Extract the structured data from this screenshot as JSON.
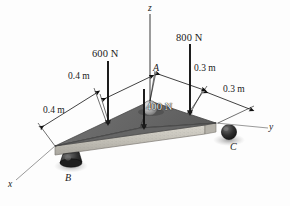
{
  "figure": {
    "type": "free-body-diagram",
    "background_color": "#fdfdfd"
  },
  "axes": [
    {
      "id": "z",
      "label": "z",
      "direction": "up"
    },
    {
      "id": "y",
      "label": "y",
      "direction": "right"
    },
    {
      "id": "x",
      "label": "x",
      "direction": "lower-left"
    }
  ],
  "points": [
    {
      "id": "A",
      "label": "A",
      "description": "apex-support-ball"
    },
    {
      "id": "B",
      "label": "B",
      "description": "left-corner-support"
    },
    {
      "id": "C",
      "label": "C",
      "description": "right-corner-support"
    }
  ],
  "forces": [
    {
      "id": "f600",
      "label": "600 N",
      "magnitude": 600,
      "unit": "N",
      "direction": "down"
    },
    {
      "id": "f800",
      "label": "800 N",
      "magnitude": 800,
      "unit": "N",
      "direction": "down"
    },
    {
      "id": "f400",
      "label": "400 N",
      "magnitude": 400,
      "unit": "N",
      "direction": "down"
    }
  ],
  "dimensions": [
    {
      "id": "d1",
      "label": "0.4 m",
      "value": 0.4,
      "unit": "m",
      "side": "left-upper"
    },
    {
      "id": "d2",
      "label": "0.4 m",
      "value": 0.4,
      "unit": "m",
      "side": "left-lower"
    },
    {
      "id": "d3",
      "label": "0.3 m",
      "value": 0.3,
      "unit": "m",
      "side": "right-upper"
    },
    {
      "id": "d4",
      "label": "0.3 m",
      "value": 0.3,
      "unit": "m",
      "side": "right-lower"
    }
  ],
  "colors": {
    "plate_top": "#6e6e6e",
    "plate_top_dark": "#5a5a5a",
    "plate_edge": "#c9c6bf",
    "support": "#2b2b2b",
    "line": "#1a1a1a",
    "shadow": "#9a9a9a"
  }
}
